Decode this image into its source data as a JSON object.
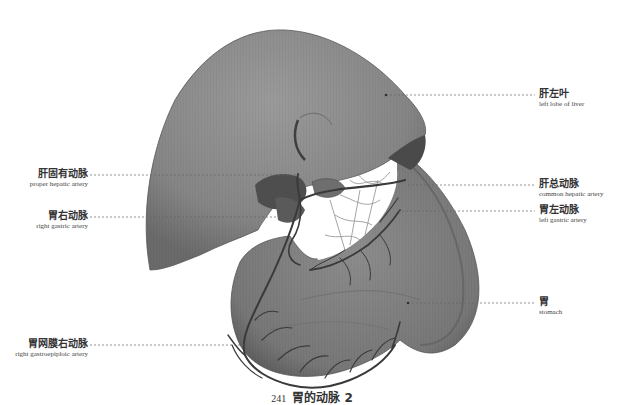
{
  "figure": {
    "caption": {
      "number": "241",
      "title": "胃的动脉 2"
    },
    "labels": [
      {
        "id": "left-lobe-of-liver",
        "zh": "肝左叶",
        "en": "left lobe of liver",
        "side": "right",
        "y": 95,
        "line_start_x": 386
      },
      {
        "id": "proper-hepatic-artery",
        "zh": "肝固有动脉",
        "en": "proper hepatic artery",
        "side": "left",
        "y": 175,
        "line_end_x": 302
      },
      {
        "id": "common-hepatic-artery",
        "zh": "肝总动脉",
        "en": "common hepatic artery",
        "side": "right",
        "y": 185,
        "line_start_x": 408
      },
      {
        "id": "left-gastric-artery",
        "zh": "胃左动脉",
        "en": "left gastric artery",
        "side": "right",
        "y": 211,
        "line_start_x": 398
      },
      {
        "id": "right-gastric-artery",
        "zh": "胃右动脉",
        "en": "right gastric artery",
        "side": "left",
        "y": 217,
        "line_end_x": 282
      },
      {
        "id": "stomach",
        "zh": "胃",
        "en": "stomach",
        "side": "right",
        "y": 303,
        "line_start_x": 408
      },
      {
        "id": "right-gastroepiploic-artery",
        "zh": "胃网膜右动脉",
        "en": "right gastroepiploic artery",
        "side": "left",
        "y": 345,
        "line_end_x": 246
      }
    ],
    "colors": {
      "organ_fill": "#8a8a8a",
      "organ_dark": "#4a4a4a",
      "vessel": "#3a3a3a",
      "leader_line": "#666666",
      "background": "#ffffff"
    }
  }
}
